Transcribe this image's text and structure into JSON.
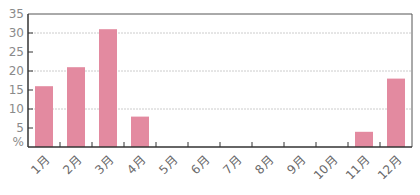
{
  "chart_data": {
    "type": "bar",
    "title": "",
    "xlabel": "",
    "ylabel": "%",
    "categories": [
      "1月",
      "2月",
      "3月",
      "4月",
      "5月",
      "6月",
      "7月",
      "8月",
      "9月",
      "10月",
      "11月",
      "12月"
    ],
    "values": [
      16,
      21,
      31,
      8,
      0,
      0,
      0,
      0,
      0,
      0,
      4,
      18
    ],
    "ylim": [
      0,
      35
    ],
    "yticks": [
      5,
      10,
      15,
      20,
      25,
      30,
      35
    ],
    "y_unit_label": "%",
    "gridlines": [
      10,
      20,
      30
    ],
    "grid": true,
    "legend": "none",
    "bar_color": "#e38aa0",
    "axis_color": "#333333",
    "grid_color": "#cccccc"
  }
}
